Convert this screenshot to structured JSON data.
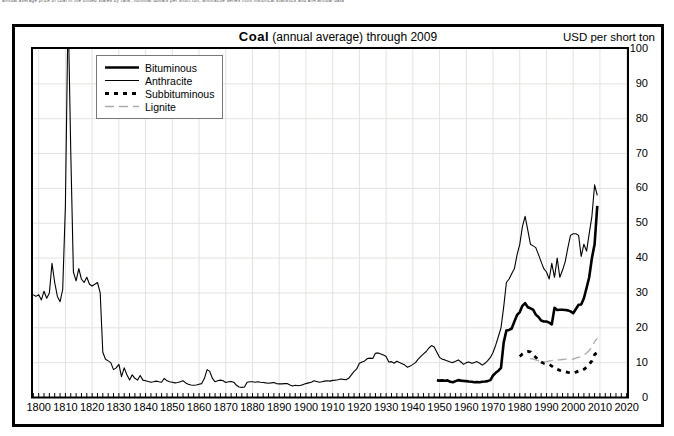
{
  "page": {
    "illegible_clipped_caption": "annual average price of coal in the united states by rank, nominal dollars per short ton, anthracite series from historical statistics and EIA annual data"
  },
  "header": {
    "title_bold": "Coal",
    "title_rest": " (annual average) through 2009",
    "unit_label": "USD per short ton"
  },
  "colors": {
    "background": "#ffffff",
    "frame": "#000000",
    "grid": "#e2e2de",
    "lignite_gray": "#aaaaaa"
  },
  "chart_data": {
    "type": "line",
    "title": "Coal (annual average) through 2009",
    "ylabel": "USD per short ton",
    "grid": true,
    "legend_position": "top-left",
    "x_axis": {
      "min": 1797.5,
      "max": 2020.5,
      "tick_start": 1800,
      "tick_end": 2020,
      "tick_step": 10,
      "minor_tick_step": 2
    },
    "y_axis": {
      "min": 0,
      "max": 100,
      "tick_step": 10,
      "note": "anthracite spike ~1811 exceeds 100 and is clipped at plot top"
    },
    "series": [
      {
        "name": "Bituminous",
        "style": {
          "color": "#000000",
          "width": 2.6,
          "dash": null
        },
        "start_year": 1949,
        "values": [
          4.9,
          4.85,
          4.9,
          4.8,
          4.9,
          4.5,
          4.4,
          4.7,
          5.0,
          4.85,
          4.75,
          4.7,
          4.6,
          4.5,
          4.4,
          4.45,
          4.4,
          4.5,
          4.6,
          4.7,
          5.0,
          6.3,
          7.1,
          7.7,
          8.5,
          15.8,
          19.2,
          19.4,
          19.8,
          21.8,
          23.7,
          24.5,
          26.3,
          27.1,
          25.9,
          25.6,
          25.2,
          23.8,
          23.1,
          22.1,
          21.8,
          21.8,
          21.5,
          21.0,
          25.7,
          25.1,
          25.2,
          25.2,
          25.1,
          25.0,
          24.7,
          24.2,
          25.4,
          26.6,
          26.7,
          28.5,
          31.5,
          34.5,
          40.0,
          44.0,
          55.0
        ]
      },
      {
        "name": "Anthracite",
        "style": {
          "color": "#000000",
          "width": 1.1,
          "dash": null
        },
        "start_year": 1798,
        "values": [
          29.5,
          29,
          29.5,
          28,
          30.5,
          28.5,
          30,
          38.5,
          33,
          29,
          27.5,
          31,
          55,
          112,
          70,
          36,
          33.5,
          37,
          34,
          33,
          34.5,
          32.5,
          32,
          32.5,
          33,
          30,
          13,
          11,
          10.5,
          10,
          8,
          8.5,
          9.5,
          6,
          8.5,
          6.5,
          5,
          6.5,
          5.5,
          5,
          6.3,
          5,
          4.8,
          4.6,
          4.4,
          4.5,
          4.7,
          4.5,
          4.4,
          5.5,
          4.8,
          4.5,
          4.4,
          4.2,
          4.3,
          4.5,
          4.8,
          4.2,
          3.8,
          3.6,
          3.5,
          3.6,
          3.8,
          4,
          5.5,
          8,
          7.5,
          5.5,
          4.5,
          4.8,
          5,
          4.8,
          4.3,
          4.5,
          4.6,
          4.4,
          3.5,
          3,
          2.9,
          3,
          4.4,
          4.5,
          4.5,
          4.4,
          4.5,
          4.4,
          4.3,
          4.2,
          4.1,
          4.2,
          4.3,
          4,
          3.9,
          3.9,
          4,
          4,
          3.6,
          3.3,
          3.5,
          3.4,
          3.5,
          3.7,
          4,
          4.2,
          4.4,
          4.8,
          4.6,
          4.4,
          4.5,
          4.7,
          4.8,
          4.7,
          4.9,
          5,
          5.1,
          5.3,
          5.2,
          5.1,
          5.5,
          6.5,
          7.5,
          8.2,
          9.8,
          10.2,
          10.5,
          11.2,
          11.3,
          11.2,
          12.7,
          12.8,
          12.5,
          12.2,
          11.8,
          10.2,
          10.3,
          9.8,
          10.4,
          10,
          9.7,
          9.3,
          8.7,
          9,
          9.5,
          10,
          11,
          11.8,
          12.5,
          13.2,
          14.2,
          14.9,
          14.5,
          13,
          11.5,
          11,
          10.8,
          10.5,
          10.2,
          10,
          10.4,
          10.8,
          10.2,
          9.5,
          10,
          10.2,
          9.8,
          10,
          10.3,
          9.8,
          9.3,
          9.8,
          10.6,
          11.5,
          12.9,
          15,
          17.5,
          20,
          26,
          33,
          34,
          35.5,
          37,
          41,
          44,
          49,
          52,
          48,
          44,
          43.5,
          43,
          41,
          39,
          37,
          36,
          34,
          38.5,
          34.5,
          40,
          34.5,
          36.5,
          39,
          43,
          46.5,
          47,
          47,
          46.5,
          40.5,
          44,
          42,
          47,
          52,
          61,
          58
        ]
      },
      {
        "name": "Subbituminous",
        "style": {
          "color": "#000000",
          "width": 2.8,
          "dash": "4 5"
        },
        "start_year": 1980,
        "values": [
          11.8,
          12.5,
          13.0,
          13.2,
          13.1,
          12.3,
          11.5,
          10.8,
          10.2,
          9.8,
          9.7,
          9.5,
          9.0,
          8.5,
          8.1,
          7.8,
          7.6,
          7.4,
          7.2,
          7.1,
          7.0,
          7.3,
          7.6,
          7.7,
          8.1,
          8.7,
          9.5,
          10.5,
          12.3,
          13.0
        ]
      },
      {
        "name": "Lignite",
        "style": {
          "color": "#aaaaaa",
          "width": 1.3,
          "dash": "9 5"
        },
        "start_year": 1984,
        "values": [
          11.2,
          11.0,
          10.8,
          10.5,
          10.3,
          10.2,
          10.3,
          10.5,
          10.6,
          10.7,
          10.8,
          10.8,
          10.9,
          11.0,
          11.0,
          11.0,
          11.0,
          11.3,
          11.5,
          11.7,
          12.2,
          12.8,
          13.5,
          14.5,
          16.0,
          17.0
        ]
      }
    ]
  }
}
